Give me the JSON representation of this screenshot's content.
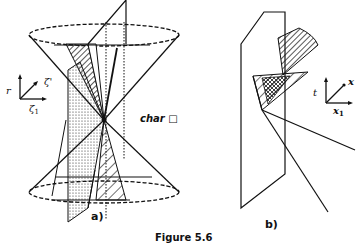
{
  "figure": {
    "caption": "Figure 5.6",
    "panels": [
      {
        "id": "a",
        "label": "a)"
      },
      {
        "id": "b",
        "label": "b)"
      }
    ]
  },
  "panel_a": {
    "annotation": "char",
    "annotation_symbol": "□",
    "axes": {
      "vertical": "r",
      "diagonal": "ζ'",
      "horizontal": "ζ",
      "horizontal_sub": "1"
    },
    "elements": [
      "double cone",
      "dotted plane",
      "hatched wedge (upper)",
      "hatched wedge (lower)",
      "vertical slicing plane"
    ]
  },
  "panel_b": {
    "axes": {
      "vertical": "t",
      "diagonal": "x",
      "horizontal": "x",
      "horizontal_sub": "1"
    },
    "elements": [
      "vertical plane",
      "hatched sector",
      "cross-hatched triangle",
      "rays"
    ]
  }
}
